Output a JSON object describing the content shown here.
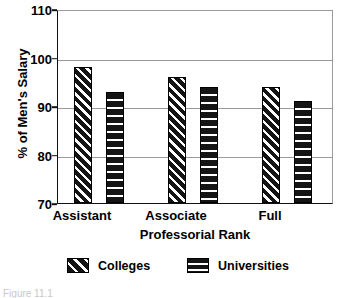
{
  "chart_data": {
    "type": "bar",
    "title": "",
    "xlabel": "Professorial Rank",
    "ylabel": "% of Men's Salary",
    "categories": [
      "Assistant",
      "Associate",
      "Full"
    ],
    "series": [
      {
        "name": "Colleges",
        "values": [
          98,
          96,
          94
        ]
      },
      {
        "name": "Universities",
        "values": [
          93,
          94,
          91
        ]
      }
    ],
    "ylim": [
      70,
      110
    ],
    "yticks": [
      70,
      80,
      90,
      100,
      110
    ],
    "ytick_labels": [
      "70",
      "80",
      "90",
      "100",
      "110"
    ],
    "grid": true,
    "legend_position": "bottom",
    "legend": [
      {
        "label": "Colleges",
        "pattern": "diagonal-hatch"
      },
      {
        "label": "Universities",
        "pattern": "horizontal-stripes"
      }
    ]
  },
  "axes": {
    "ylabel": "% of Men's Salary",
    "xlabel": "Professorial Rank",
    "ytick_labels": [
      "110",
      "100",
      "90",
      "80",
      "70"
    ],
    "xtick_labels": [
      "Assistant",
      "Associate",
      "Full"
    ]
  },
  "legend": {
    "entries": [
      {
        "label": "Colleges"
      },
      {
        "label": "Universities"
      }
    ]
  },
  "caption": {
    "text": "Figure 11.1"
  }
}
